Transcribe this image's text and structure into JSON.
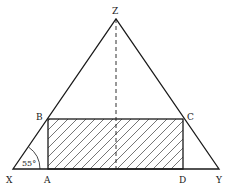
{
  "diagram": {
    "type": "geometry",
    "colors": {
      "stroke": "#1a1a1a",
      "background": "#ffffff"
    },
    "points": {
      "X": {
        "label": "X",
        "x": 13,
        "y": 169
      },
      "Y": {
        "label": "Y",
        "x": 219,
        "y": 169
      },
      "Z": {
        "label": "Z",
        "x": 116,
        "y": 19
      },
      "A": {
        "label": "A",
        "x": 48,
        "y": 169
      },
      "B": {
        "label": "B",
        "x": 48,
        "y": 119
      },
      "C": {
        "label": "C",
        "x": 183,
        "y": 119
      },
      "D": {
        "label": "D",
        "x": 183,
        "y": 169
      }
    },
    "labels": {
      "X": "X",
      "Y": "Y",
      "Z": "Z",
      "A": "A",
      "B": "B",
      "C": "C",
      "D": "D"
    },
    "angle": {
      "vertex": "X",
      "value": "55°"
    },
    "triangle": [
      "X",
      "Y",
      "Z"
    ],
    "rectangle": {
      "vertices": [
        "A",
        "B",
        "C",
        "D"
      ],
      "shading": "diagonal-hatch"
    },
    "altitude": {
      "from": "Z",
      "style": "dashed"
    }
  }
}
